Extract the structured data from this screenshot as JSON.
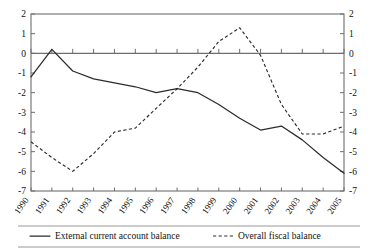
{
  "chart_data": {
    "type": "line",
    "title": "",
    "xlabel": "",
    "ylabel": "",
    "ylim": [
      -7,
      2
    ],
    "grid": false,
    "legend_position": "bottom",
    "dual_axis": true,
    "categories": [
      "1990",
      "1991",
      "1992",
      "1993",
      "1994",
      "1995",
      "1996",
      "1997",
      "1998",
      "1999",
      "2000",
      "2001",
      "2002",
      "2003",
      "2004",
      "2005"
    ],
    "ytick_labels": [
      "2",
      "1",
      "0",
      "-1",
      "-2",
      "-3",
      "-4",
      "-5",
      "-6",
      "-7"
    ],
    "ytick_values": [
      2,
      1,
      0,
      -1,
      -2,
      -3,
      -4,
      -5,
      -6,
      -7
    ],
    "ytick_labels_right": [
      "2",
      "1",
      "0",
      "-1",
      "-2",
      "-3",
      "-4",
      "-5",
      "-6",
      "-7"
    ],
    "series": [
      {
        "name": "External current account balance",
        "style": "solid",
        "color": "#2b2b2b",
        "values": [
          -1.2,
          0.2,
          -0.9,
          -1.3,
          -1.5,
          -1.7,
          -2.0,
          -1.8,
          -2.0,
          -2.6,
          -3.3,
          -3.9,
          -3.7,
          -4.4,
          -5.3,
          -6.1
        ]
      },
      {
        "name": "Overall fiscal balance",
        "style": "dashed",
        "color": "#2b2b2b",
        "values": [
          -4.5,
          -5.3,
          -6.0,
          -5.1,
          -4.0,
          -3.8,
          -2.8,
          -1.8,
          -0.7,
          0.6,
          1.3,
          -0.1,
          -2.6,
          -4.1,
          -4.1,
          -3.7
        ]
      }
    ]
  },
  "legend": {
    "items": [
      {
        "label": "External current account balance",
        "marker": "solid-line-swatch"
      },
      {
        "label": "Overall fiscal balance",
        "marker": "dashed-line-swatch"
      }
    ]
  }
}
